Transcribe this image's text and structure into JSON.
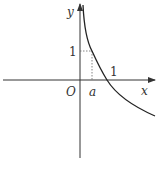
{
  "diagram": {
    "type": "function-graph",
    "labels": {
      "y_axis": "y",
      "x_axis": "x",
      "origin": "O",
      "point_a": "a",
      "y_tick": "1",
      "x_tick": "1"
    },
    "curve": "decreasing logarithmic-like curve passing through (a,1) and (1,0)",
    "colors": {
      "axes": "#333333",
      "curve": "#222222",
      "guides": "#666666"
    }
  }
}
